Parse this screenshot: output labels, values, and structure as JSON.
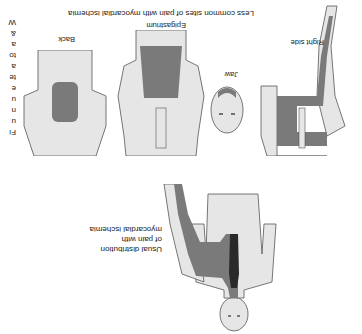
{
  "figure": {
    "orientation": "rotated-180",
    "main": {
      "label_lines": [
        "Usual distribution",
        "of pain with",
        "myocardial ischemia"
      ]
    },
    "less_common": {
      "caption": "Less common sites of pain with myocardial ischemia",
      "panels": [
        {
          "label": "Right side"
        },
        {
          "label": "Jaw"
        },
        {
          "label": "Epigastrium"
        },
        {
          "label": "Back"
        }
      ]
    },
    "side_text_fragments": [
      "Fi",
      "u",
      "n",
      "u",
      "e",
      "te",
      "a",
      "to",
      "a",
      "&",
      "W"
    ],
    "colors": {
      "skin": "#e6e6e6",
      "outline": "#555555",
      "pain": "#7a7a7a",
      "dark_pain": "#2a2a2a"
    }
  }
}
